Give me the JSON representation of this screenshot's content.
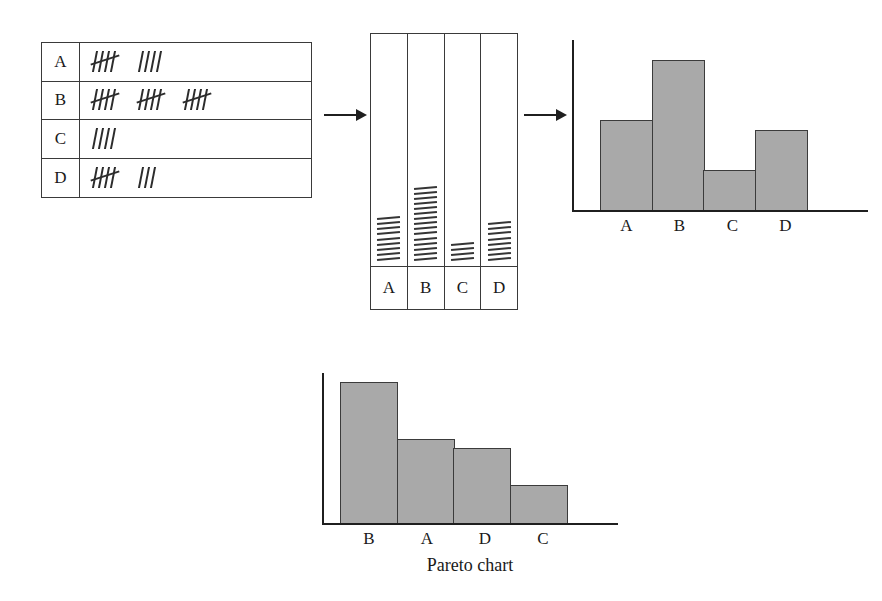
{
  "figure": {
    "caption": "Pareto chart"
  },
  "tally_table": {
    "rows": [
      {
        "label": "A",
        "count": 9,
        "groups": [
          5,
          4
        ]
      },
      {
        "label": "B",
        "count": 15,
        "groups": [
          5,
          5,
          5
        ]
      },
      {
        "label": "C",
        "count": 4,
        "groups": [
          4
        ]
      },
      {
        "label": "D",
        "count": 8,
        "groups": [
          5,
          3
        ]
      }
    ]
  },
  "dash_columns": {
    "columns": [
      {
        "label": "A",
        "marks": 9
      },
      {
        "label": "B",
        "marks": 15
      },
      {
        "label": "C",
        "marks": 4
      },
      {
        "label": "D",
        "marks": 8
      }
    ]
  },
  "arrows": {
    "table_to_columns": "arrow-right",
    "columns_to_histogram": "arrow-right"
  },
  "colors": {
    "bar_fill": "#a9a9a9",
    "bar_stroke": "#3b3b3b",
    "axis": "#1f1f1f",
    "table_border": "#3a3a3a",
    "background": "#ffffff"
  },
  "chart_data": [
    {
      "type": "bar",
      "name": "histogram",
      "title": "",
      "xlabel": "",
      "ylabel": "",
      "categories": [
        "A",
        "B",
        "C",
        "D"
      ],
      "values": [
        9,
        15,
        4,
        8
      ],
      "ylim": [
        0,
        16
      ],
      "grid": false,
      "legend": "none",
      "bar_gap": 0,
      "note": "Histogram of tally counts in original category order"
    },
    {
      "type": "bar",
      "name": "pareto",
      "title": "Pareto chart",
      "xlabel": "",
      "ylabel": "",
      "categories": [
        "B",
        "A",
        "D",
        "C"
      ],
      "values": [
        15,
        9,
        8,
        4
      ],
      "ylim": [
        0,
        16
      ],
      "grid": false,
      "legend": "none",
      "bar_gap": 0,
      "note": "Same counts sorted in descending order"
    }
  ]
}
